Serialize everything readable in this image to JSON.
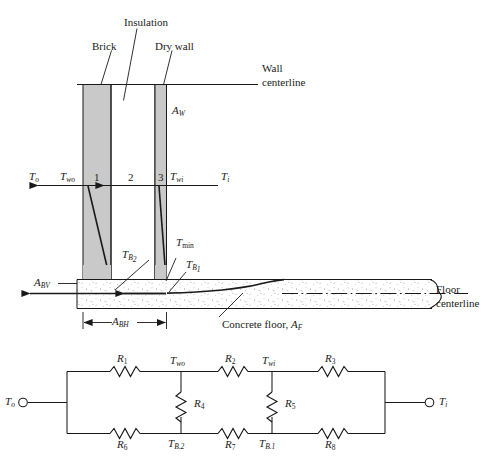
{
  "figure": {
    "type": "thermal-resistance-wall-floor-diagram",
    "upper": {
      "materials": [
        {
          "name": "brick",
          "label": "Brick"
        },
        {
          "name": "insulation",
          "label": "Insulation"
        },
        {
          "name": "dry-wall",
          "label": "Dry wall"
        }
      ],
      "centerlines": [
        {
          "name": "wall-centerline",
          "label_line1": "Wall",
          "label_line2": "centerline"
        },
        {
          "name": "floor-centerline",
          "label_line1": "Floor",
          "label_line2": "centerline"
        }
      ],
      "areas": {
        "wall": "A",
        "wall_sub": "W",
        "basement_vertical": "A",
        "basement_vertical_sub": "BV",
        "basement_horizontal": "A",
        "basement_horizontal_sub": "BH",
        "floor": "A",
        "floor_sub": "F"
      },
      "temps": {
        "outside": "T",
        "outside_sub": "o",
        "wall_outer": "T",
        "wall_outer_sub": "wo",
        "wall_inner": "T",
        "wall_inner_sub": "wi",
        "inside": "T",
        "inside_sub": "i",
        "min": "T",
        "min_sub": "min",
        "b1": "T",
        "b1_sub": "B",
        "b1_sub2": "1",
        "b2": "T",
        "b2_sub": "B",
        "b2_sub2": "2"
      },
      "layer_numbers": [
        "1",
        "2",
        "3"
      ],
      "concrete_floor_label": "Concrete floor, ",
      "concrete_floor_sym": "A",
      "concrete_floor_sub": "F"
    },
    "circuit": {
      "terminal_left": "T",
      "terminal_left_sub": "o",
      "terminal_right": "T",
      "terminal_right_sub": "i",
      "resistors": [
        {
          "name": "R1",
          "sym": "R",
          "sub": "1"
        },
        {
          "name": "R2",
          "sym": "R",
          "sub": "2"
        },
        {
          "name": "R3",
          "sym": "R",
          "sub": "3"
        },
        {
          "name": "R4",
          "sym": "R",
          "sub": "4"
        },
        {
          "name": "R5",
          "sym": "R",
          "sub": "5"
        },
        {
          "name": "R6",
          "sym": "R",
          "sub": "6"
        },
        {
          "name": "R7",
          "sym": "R",
          "sub": "7"
        },
        {
          "name": "R8",
          "sym": "R",
          "sub": "8"
        }
      ],
      "nodes": [
        {
          "name": "node-two-wo",
          "sym": "T",
          "sub": "wo"
        },
        {
          "name": "node-two-wi",
          "sym": "T",
          "sub": "wi"
        },
        {
          "name": "node-tb2",
          "sym": "T",
          "sub": "B.2"
        },
        {
          "name": "node-tb1",
          "sym": "T",
          "sub": "B.1"
        }
      ]
    },
    "colors": {
      "line": "#1a1a1a",
      "material_fill": "#c9c9c9",
      "concrete_fill": "#ffffff",
      "background": "#ffffff"
    }
  }
}
